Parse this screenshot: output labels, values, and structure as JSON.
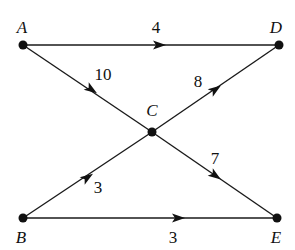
{
  "diagram": {
    "type": "directed-weighted-graph",
    "nodes": [
      {
        "id": "A",
        "label": "A",
        "x": 23,
        "y": 45,
        "lx": 22,
        "ly": 33
      },
      {
        "id": "D",
        "label": "D",
        "x": 279,
        "y": 45,
        "lx": 276,
        "ly": 33
      },
      {
        "id": "C",
        "label": "C",
        "x": 152,
        "y": 132,
        "lx": 152,
        "ly": 116
      },
      {
        "id": "B",
        "label": "B",
        "x": 23,
        "y": 218,
        "lx": 21,
        "ly": 243
      },
      {
        "id": "E",
        "label": "E",
        "x": 277,
        "y": 218,
        "lx": 276,
        "ly": 243
      }
    ],
    "edges": [
      {
        "from": "A",
        "to": "D",
        "weight": "4",
        "lx": 156,
        "ly": 33,
        "ax": 160,
        "ay": 45
      },
      {
        "from": "A",
        "to": "C",
        "weight": "10",
        "lx": 103,
        "ly": 80,
        "ax": 92,
        "ay": 90
      },
      {
        "from": "C",
        "to": "D",
        "weight": "8",
        "lx": 198,
        "ly": 87,
        "ax": 216,
        "ay": 89
      },
      {
        "from": "C",
        "to": "E",
        "weight": "7",
        "lx": 215,
        "ly": 164,
        "ax": 216,
        "ay": 176
      },
      {
        "from": "B",
        "to": "C",
        "weight": "3",
        "lx": 98,
        "ly": 193,
        "ax": 88,
        "ay": 177
      },
      {
        "from": "B",
        "to": "E",
        "weight": "3",
        "lx": 173,
        "ly": 243,
        "ax": 179,
        "ay": 218
      }
    ]
  }
}
